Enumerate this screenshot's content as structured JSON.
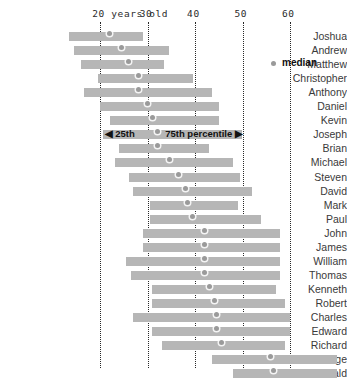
{
  "chart_data": {
    "type": "bar",
    "title": "",
    "xlabel": "years old",
    "ylabel": "",
    "orientation": "horizontal",
    "bar_kind": "floating-range",
    "xlim": [
      12,
      72
    ],
    "grid": "vertical-dotted",
    "axis_ticks": [
      {
        "value": 20,
        "label": "20"
      },
      {
        "value": 30,
        "label": "30"
      },
      {
        "value": 40,
        "label": "40"
      },
      {
        "value": 50,
        "label": "50"
      },
      {
        "value": 60,
        "label": "60"
      }
    ],
    "axis_unit_label": "years old",
    "legend": {
      "position": "top-right",
      "entries": [
        {
          "label": "median",
          "marker": "dot",
          "color": "#9a9a9a"
        }
      ]
    },
    "annotations": [
      {
        "row": "Joseph",
        "left_label": "◀ 25th",
        "right_label": "75th percentile ▶"
      }
    ],
    "series_note": "each bar spans the 25th to 75th percentile; dot is the median",
    "categories": [
      "Joshua",
      "Andrew",
      "Matthew",
      "Christopher",
      "Anthony",
      "Daniel",
      "Kevin",
      "Joseph",
      "Brian",
      "Michael",
      "Steven",
      "David",
      "Mark",
      "Paul",
      "John",
      "James",
      "William",
      "Thomas",
      "Kenneth",
      "Robert",
      "Charles",
      "Edward",
      "Richard",
      "George",
      "Donald"
    ],
    "rows": [
      {
        "name": "Joshua",
        "p25": 13.5,
        "p75": 29.0,
        "median": 22.0
      },
      {
        "name": "Andrew",
        "p25": 14.5,
        "p75": 34.5,
        "median": 24.5
      },
      {
        "name": "Matthew",
        "p25": 16.0,
        "p75": 33.5,
        "median": 26.0
      },
      {
        "name": "Christopher",
        "p25": 19.5,
        "p75": 39.5,
        "median": 28.0
      },
      {
        "name": "Anthony",
        "p25": 16.5,
        "p75": 43.5,
        "median": 28.0
      },
      {
        "name": "Daniel",
        "p25": 20.0,
        "p75": 45.0,
        "median": 30.0
      },
      {
        "name": "Kevin",
        "p25": 22.0,
        "p75": 45.0,
        "median": 31.0
      },
      {
        "name": "Joseph",
        "p25": 20.5,
        "p75": 50.0,
        "median": 32.0
      },
      {
        "name": "Brian",
        "p25": 24.0,
        "p75": 43.0,
        "median": 32.0
      },
      {
        "name": "Michael",
        "p25": 23.0,
        "p75": 48.0,
        "median": 34.5
      },
      {
        "name": "Steven",
        "p25": 26.0,
        "p75": 49.5,
        "median": 36.5
      },
      {
        "name": "David",
        "p25": 27.0,
        "p75": 52.0,
        "median": 38.0
      },
      {
        "name": "Mark",
        "p25": 30.5,
        "p75": 49.0,
        "median": 38.5
      },
      {
        "name": "Paul",
        "p25": 30.5,
        "p75": 54.0,
        "median": 39.5
      },
      {
        "name": "John",
        "p25": 29.0,
        "p75": 58.0,
        "median": 42.0
      },
      {
        "name": "James",
        "p25": 29.0,
        "p75": 58.0,
        "median": 42.0
      },
      {
        "name": "William",
        "p25": 25.5,
        "p75": 58.0,
        "median": 42.0
      },
      {
        "name": "Thomas",
        "p25": 26.5,
        "p75": 58.0,
        "median": 42.0
      },
      {
        "name": "Kenneth",
        "p25": 31.0,
        "p75": 57.0,
        "median": 43.0
      },
      {
        "name": "Robert",
        "p25": 31.0,
        "p75": 59.0,
        "median": 44.0
      },
      {
        "name": "Charles",
        "p25": 27.0,
        "p75": 60.0,
        "median": 44.5
      },
      {
        "name": "Edward",
        "p25": 31.0,
        "p75": 60.0,
        "median": 44.5
      },
      {
        "name": "Richard",
        "p25": 33.0,
        "p75": 59.0,
        "median": 45.5
      },
      {
        "name": "George",
        "p25": 43.5,
        "p75": 70.0,
        "median": 56.0
      },
      {
        "name": "Donald",
        "p25": 48.0,
        "p75": 70.0,
        "median": 56.5
      }
    ]
  }
}
